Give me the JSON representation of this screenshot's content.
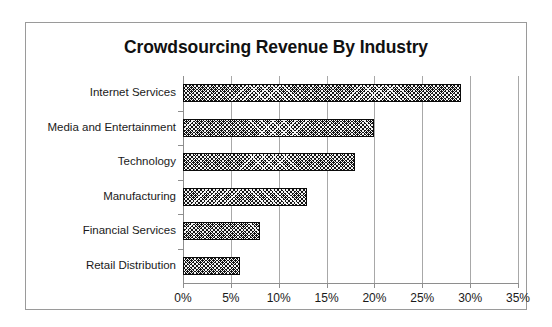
{
  "chart_data": {
    "type": "bar",
    "orientation": "horizontal",
    "title": "Crowdsourcing Revenue By Industry",
    "xlabel": "",
    "ylabel": "",
    "categories": [
      "Internet Services",
      "Media and Entertainment",
      "Technology",
      "Manufacturing",
      "Financial Services",
      "Retail Distribution"
    ],
    "values": [
      29,
      20,
      18,
      13,
      8,
      6
    ],
    "value_unit": "%",
    "xlim": [
      0,
      35
    ],
    "xticks": [
      0,
      5,
      10,
      15,
      20,
      25,
      30,
      35
    ],
    "xtick_labels": [
      "0%",
      "5%",
      "10%",
      "15%",
      "20%",
      "25%",
      "30%",
      "35%"
    ],
    "grid": "vertical",
    "legend": "none",
    "bar_fill": "#141414",
    "bar_pattern": "dotted-crosshatch",
    "axis_color": "#8e8e8e",
    "frame_border_color": "#9a9a9a",
    "background": "#ffffff"
  }
}
